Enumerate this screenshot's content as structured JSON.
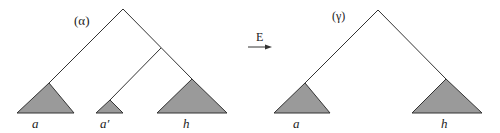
{
  "left_tree": {
    "label": "(α)",
    "leaves": [
      "a",
      "a′",
      "h"
    ]
  },
  "arrow": {
    "label": "E"
  },
  "right_tree": {
    "label": "(γ)",
    "leaves": [
      "a",
      "h"
    ]
  },
  "colors": {
    "line": "#333333",
    "triangle_fill": "#9a9a9a"
  }
}
